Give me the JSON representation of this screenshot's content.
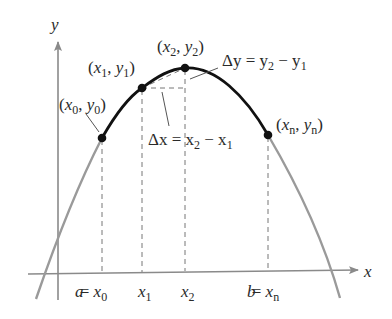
{
  "figure": {
    "type": "arc-length-partition-diagram",
    "axes": {
      "x_label": "x",
      "y_label": "y"
    },
    "points": [
      {
        "id": "p0",
        "label_x": "x",
        "label_x_sub": "0",
        "label_y": "y",
        "label_y_sub": "0"
      },
      {
        "id": "p1",
        "label_x": "x",
        "label_x_sub": "1",
        "label_y": "y",
        "label_y_sub": "1"
      },
      {
        "id": "p2",
        "label_x": "x",
        "label_x_sub": "2",
        "label_y": "y",
        "label_y_sub": "2"
      },
      {
        "id": "pn",
        "label_x": "x",
        "label_x_sub": "n",
        "label_y": "y",
        "label_y_sub": "n"
      }
    ],
    "annotations": {
      "delta_y": {
        "lhs": "Δy = y",
        "sub1": "2",
        "mid": " − y",
        "sub2": "1"
      },
      "delta_x": {
        "lhs": "Δx = x",
        "sub1": "2",
        "mid": " − x",
        "sub2": "1"
      }
    },
    "ticks": [
      {
        "prefix": "a = ",
        "var": "x",
        "sub": "0"
      },
      {
        "prefix": "",
        "var": "x",
        "sub": "1"
      },
      {
        "prefix": "",
        "var": "x",
        "sub": "2"
      },
      {
        "prefix": "b = ",
        "var": "x",
        "sub": "n"
      }
    ],
    "colors": {
      "axis": "#8a8a8a",
      "curve_outer": "#9a9a9a",
      "curve_arc": "#111111",
      "dashed": "#777777",
      "text": "#2a2a2a"
    }
  }
}
